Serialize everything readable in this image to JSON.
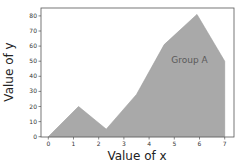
{
  "chart_data": {
    "type": "area",
    "title": "",
    "xlabel": "Value of x",
    "ylabel": "Value of y",
    "xlim": [
      -0.3,
      7.35
    ],
    "ylim": [
      0,
      85
    ],
    "xticks": [
      0,
      1,
      2,
      3,
      4,
      5,
      6,
      7
    ],
    "yticks": [
      0,
      10,
      20,
      30,
      40,
      50,
      60,
      70,
      80
    ],
    "grid": false,
    "legend": null,
    "series": [
      {
        "name": "Group A",
        "color": "#a9a9a9",
        "x": [
          0,
          1.2,
          2.3,
          3.5,
          4.6,
          5.9,
          7
        ],
        "y": [
          0,
          20,
          5,
          28,
          61,
          81,
          50
        ]
      }
    ],
    "annotations": [
      {
        "text": "Group A",
        "x": 5.6,
        "y": 51
      }
    ]
  }
}
